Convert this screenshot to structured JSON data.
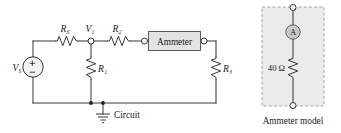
{
  "figure": {
    "type": "circuit-schematic",
    "background_color": "#ffffff",
    "wire_color": "#231f20",
    "panels": [
      {
        "id": "circuit-panel",
        "caption": "Circuit"
      },
      {
        "id": "ammeter-model-panel",
        "caption": "Ammeter model",
        "box_fill": "#ebebeb",
        "box_stroke": "#9a9a9a"
      }
    ]
  },
  "circuit": {
    "source": {
      "name": "voltage-source",
      "label": "V",
      "subscript": "S",
      "plus_sign": "+",
      "minus_sign": "−"
    },
    "nodes": [
      {
        "name": "node-v1",
        "label": "V",
        "subscript": "1"
      }
    ],
    "resistors": [
      {
        "name": "resistor-rs",
        "label": "R",
        "subscript": "S",
        "orientation": "horizontal"
      },
      {
        "name": "resistor-r2",
        "label": "R",
        "subscript": "2",
        "orientation": "horizontal"
      },
      {
        "name": "resistor-r1",
        "label": "R",
        "subscript": "1",
        "orientation": "vertical"
      },
      {
        "name": "resistor-r3",
        "label": "R",
        "subscript": "3",
        "orientation": "vertical"
      }
    ],
    "instrument": {
      "name": "ammeter-box",
      "label": "Ammeter",
      "fill": "#e3e3e3",
      "stroke": "#4d4d4d"
    },
    "ground": {
      "name": "ground-symbol",
      "label": "Circuit"
    }
  },
  "ammeter_model": {
    "meter": {
      "name": "ammeter-meter-symbol",
      "label": "A",
      "fill": "#c9c9c9",
      "stroke": "#555555"
    },
    "resistor": {
      "name": "resistor-internal",
      "value": "40 Ω"
    },
    "caption": "Ammeter model"
  }
}
